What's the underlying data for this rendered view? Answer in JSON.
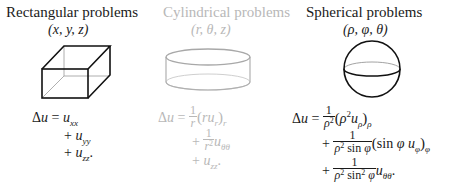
{
  "columns": [
    {
      "id": "rectangular",
      "title": "Rectangular problems",
      "coordinates": "(x, y, z)",
      "shape_icon": "box-icon",
      "style": "dark",
      "equation": {
        "lhs": "Δu =",
        "terms": [
          "u_xx",
          "+ u_yy",
          "+ u_zz."
        ]
      }
    },
    {
      "id": "cylindrical",
      "title": "Cylindrical problems",
      "coordinates": "(r, θ, z)",
      "shape_icon": "cylinder-icon",
      "style": "faded",
      "equation": {
        "lhs": "Δu =",
        "terms": [
          "(1/r)(r u_r)_r",
          "+ (1/r²) u_θθ",
          "+ u_zz."
        ]
      }
    },
    {
      "id": "spherical",
      "title": "Spherical problems",
      "coordinates": "(ρ, φ, θ)",
      "shape_icon": "sphere-icon",
      "style": "dark",
      "equation": {
        "lhs": "Δu =",
        "terms": [
          "(1/ρ²)(ρ² u_ρ)_ρ",
          "+ (1/(ρ² sin φ))(sin φ u_φ)_φ",
          "+ (1/(ρ² sin² φ)) u_θθ."
        ]
      }
    }
  ],
  "glyphs": {
    "delta": "Δ",
    "u": "u",
    "eq": "=",
    "plus": "+",
    "one": "1",
    "r": "r",
    "rho": "ρ",
    "phi": "φ",
    "theta_theta": "θθ",
    "xx": "xx",
    "yy": "yy",
    "zz": "zz",
    "sq": "2",
    "sin": "sin",
    "lparen": "(",
    "rparen": ")",
    "period": "."
  },
  "colors": {
    "dark": "#1a1a1a",
    "faded": "#b8b8b8"
  }
}
